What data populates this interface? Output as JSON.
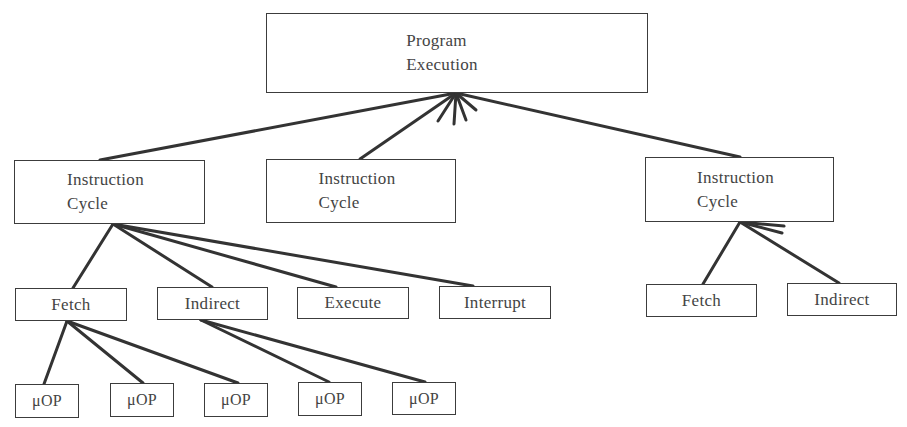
{
  "diagram": {
    "type": "hierarchy",
    "root": {
      "id": "program-execution",
      "label": "Program\nExecution"
    },
    "level1": [
      {
        "id": "instruction-cycle-1",
        "label": "Instruction\nCycle"
      },
      {
        "id": "instruction-cycle-2",
        "label": "Instruction\nCycle"
      },
      {
        "id": "instruction-cycle-3",
        "label": "Instruction\nCycle"
      }
    ],
    "level2_left": [
      {
        "id": "fetch-1",
        "label": "Fetch"
      },
      {
        "id": "indirect-1",
        "label": "Indirect"
      },
      {
        "id": "execute-1",
        "label": "Execute"
      },
      {
        "id": "interrupt-1",
        "label": "Interrupt"
      }
    ],
    "level2_right": [
      {
        "id": "fetch-2",
        "label": "Fetch"
      },
      {
        "id": "indirect-2",
        "label": "Indirect"
      }
    ],
    "level3": [
      {
        "id": "uop-1",
        "label": "μOP",
        "parent": "fetch-1"
      },
      {
        "id": "uop-2",
        "label": "μOP",
        "parent": "fetch-1"
      },
      {
        "id": "uop-3",
        "label": "μOP",
        "parent": "fetch-1"
      },
      {
        "id": "uop-4",
        "label": "μOP",
        "parent": "indirect-1"
      },
      {
        "id": "uop-5",
        "label": "μOP",
        "parent": "indirect-1"
      }
    ],
    "colors": {
      "line": "#333333",
      "border": "#3c3c3c",
      "text": "#444444",
      "background": "#ffffff"
    }
  }
}
